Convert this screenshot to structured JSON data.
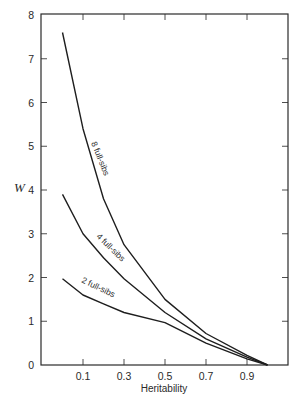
{
  "chart_data": {
    "type": "line",
    "title": "",
    "xlabel": "Heritability",
    "ylabel": "W",
    "xlim": [
      -0.1,
      1.1
    ],
    "ylim": [
      0,
      8
    ],
    "grid": false,
    "legend": "inline labels along curves",
    "x_ticks": [
      0.1,
      0.3,
      0.5,
      0.7,
      0.9
    ],
    "x_tick_labels": [
      "0.1",
      "0.3",
      "0.5",
      "0.7",
      "0.9"
    ],
    "y_ticks": [
      0,
      1,
      2,
      3,
      4,
      5,
      6,
      7,
      8
    ],
    "y_tick_labels": [
      "0",
      "1",
      "2",
      "3",
      "4",
      "5",
      "6",
      "7",
      "8"
    ],
    "x": [
      0.0,
      0.1,
      0.2,
      0.3,
      0.5,
      0.7,
      0.9,
      1.0
    ],
    "series": [
      {
        "name": "8 full-sibs",
        "values": [
          7.6,
          5.4,
          3.8,
          2.75,
          1.5,
          0.72,
          0.22,
          0.0
        ]
      },
      {
        "name": "4 full-sibs",
        "values": [
          3.9,
          3.0,
          2.45,
          1.97,
          1.2,
          0.6,
          0.18,
          0.0
        ]
      },
      {
        "name": "2 full-sibs",
        "values": [
          1.97,
          1.6,
          1.4,
          1.2,
          0.97,
          0.5,
          0.14,
          0.0
        ]
      }
    ]
  },
  "labels": {
    "xlabel": "Heritability",
    "ylabel": "W",
    "series_8": "8 full-sibs",
    "series_4": "4 full-sibs",
    "series_2": "2 full-sibs"
  }
}
